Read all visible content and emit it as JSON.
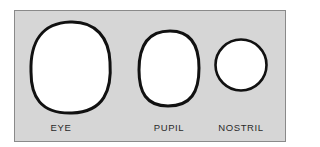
{
  "diagram": {
    "background": "#d6d6d6",
    "stroke_color": "#111111",
    "fill_color": "#ffffff",
    "shapes": [
      {
        "id": "eye",
        "label": "EYE",
        "shape": "rounded-oval"
      },
      {
        "id": "pupil",
        "label": "PUPIL",
        "shape": "rounded-oval"
      },
      {
        "id": "nostril",
        "label": "NOSTRIL",
        "shape": "circle"
      }
    ]
  }
}
